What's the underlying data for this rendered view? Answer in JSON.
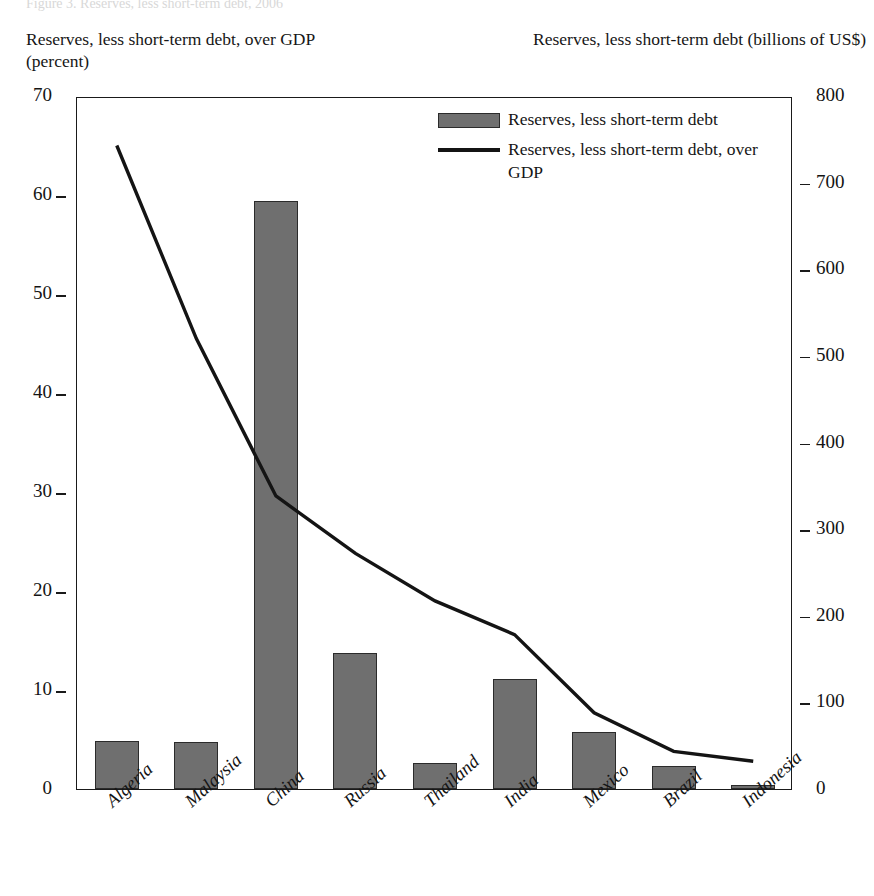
{
  "figure": {
    "cut_title": "Figure 3. Reserves, less short-term debt, 2006",
    "left_axis_caption": "Reserves, less short-term debt, over GDP (percent)",
    "right_axis_caption": "Reserves, less short-term debt (billions of US$)"
  },
  "legend": {
    "items": [
      {
        "key": "bar-swatch",
        "label": "Reserves, less short-term debt"
      },
      {
        "key": "line-swatch",
        "label": "Reserves, less short-term debt, over GDP"
      }
    ]
  },
  "chart_data": {
    "type": "bar",
    "title": "Reserves, less short-term debt",
    "categories": [
      "Algeria",
      "Malaysia",
      "China",
      "Russia",
      "Thailand",
      "India",
      "Mexico",
      "Brazil",
      "Indonesia"
    ],
    "series": [
      {
        "name": "Reserves, less short-term debt",
        "type": "bar",
        "axis": "right",
        "unit": "billions of US$",
        "values": [
          57,
          55,
          690,
          159,
          30,
          129,
          67,
          27,
          9
        ]
      },
      {
        "name": "Reserves, less short-term debt, over GDP",
        "type": "line",
        "axis": "left",
        "unit": "percent",
        "values": [
          65.2,
          45.7,
          29.8,
          24.0,
          19.2,
          15.8,
          7.9,
          4.0,
          3.0
        ]
      }
    ],
    "bar_values_left_axis_percent": [
      4.9,
      4.7,
      59.4,
      13.7,
      2.6,
      11.1,
      5.8,
      2.3,
      0.4
    ],
    "left_axis": {
      "label": "Reserves, less short-term debt, over GDP (percent)",
      "ticks": [
        0,
        10,
        20,
        30,
        40,
        50,
        60,
        70
      ],
      "ylim": [
        0,
        70
      ]
    },
    "right_axis": {
      "label": "Reserves, less short-term debt (billions of US$)",
      "ticks": [
        0,
        100,
        200,
        300,
        400,
        500,
        600,
        700,
        800
      ],
      "ylim": [
        0,
        800
      ]
    },
    "xlabel": "",
    "grid": false,
    "legend_position": "top-center",
    "colors": {
      "bar_fill": "#6f6f6f",
      "bar_border": "#2b2b2b",
      "line": "#141414",
      "axis": "#1a1a1a",
      "background": "#ffffff"
    }
  }
}
